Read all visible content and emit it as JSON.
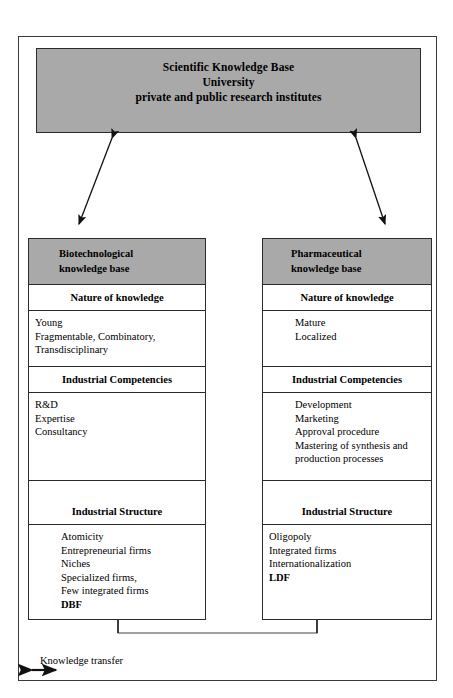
{
  "top_box": {
    "lines": [
      "Scientific Knowledge Base",
      "University",
      "private and public research institutes"
    ],
    "fill_color": "#a9a9a9"
  },
  "columns": [
    {
      "id": "biotechnological",
      "header": [
        "Biotechnological",
        "knowledge base"
      ],
      "header_fill": "#a9a9a9",
      "sections": [
        {
          "title": "Nature of knowledge",
          "items": [
            {
              "text": "Young",
              "bold": false
            },
            {
              "text": "Fragmentable, Combinatory,",
              "bold": false
            },
            {
              "text": "Transdisciplinary",
              "bold": false
            }
          ]
        },
        {
          "title": "Industrial Competencies",
          "items": [
            {
              "text": "R&D",
              "bold": false
            },
            {
              "text": "Expertise",
              "bold": false
            },
            {
              "text": "Consultancy",
              "bold": false
            }
          ]
        },
        {
          "title": "Industrial Structure",
          "items": [
            {
              "text": "Atomicity",
              "bold": false
            },
            {
              "text": "Entrepreneurial firms",
              "bold": false
            },
            {
              "text": "Niches",
              "bold": false
            },
            {
              "text": "Specialized firms,",
              "bold": false
            },
            {
              "text": "Few integrated firms",
              "bold": false
            },
            {
              "text": "DBF",
              "bold": true
            }
          ]
        }
      ]
    },
    {
      "id": "pharmaceutical",
      "header": [
        "Pharmaceutical",
        "knowledge base"
      ],
      "header_fill": "#a9a9a9",
      "sections": [
        {
          "title": "Nature of knowledge",
          "items": [
            {
              "text": "Mature",
              "bold": false
            },
            {
              "text": "Localized",
              "bold": false
            }
          ]
        },
        {
          "title": "Industrial Competencies",
          "items": [
            {
              "text": "Development",
              "bold": false
            },
            {
              "text": "Marketing",
              "bold": false
            },
            {
              "text": "Approval procedure",
              "bold": false
            },
            {
              "text": "Mastering of synthesis and",
              "bold": false
            },
            {
              "text": "production processes",
              "bold": false
            }
          ]
        },
        {
          "title": "Industrial Structure",
          "items": [
            {
              "text": "Oligopoly",
              "bold": false
            },
            {
              "text": "Integrated firms",
              "bold": false
            },
            {
              "text": "Internationalization",
              "bold": false
            },
            {
              "text": "LDF",
              "bold": true
            }
          ]
        }
      ]
    }
  ],
  "legend": {
    "icon": "double-headed-arrow-icon",
    "label": "Knowledge transfer"
  },
  "connectors": [
    {
      "name": "top-left-double-arrow",
      "type": "double-headed-diagonal"
    },
    {
      "name": "top-right-double-arrow",
      "type": "double-headed-diagonal"
    },
    {
      "name": "bottom-u-connector",
      "type": "u-shaped-double-arrow"
    }
  ]
}
